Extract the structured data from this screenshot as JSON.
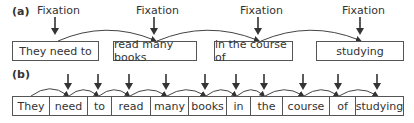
{
  "panel_a": {
    "label": "(a)",
    "fixation_label": "Fixation",
    "chunks": [
      {
        "text": "They need to",
        "x": 12,
        "w": 87
      },
      {
        "text": "read many books",
        "x": 113,
        "w": 84
      },
      {
        "text": "in the course of",
        "x": 214,
        "w": 79
      },
      {
        "text": "studying",
        "x": 316,
        "w": 88
      }
    ],
    "fixation_x": [
      55,
      153,
      253,
      360
    ]
  },
  "panel_b": {
    "label": "(b)",
    "words": [
      {
        "text": "They",
        "x": 12,
        "w": 38
      },
      {
        "text": "need",
        "x": 49,
        "w": 39
      },
      {
        "text": "to",
        "x": 87,
        "w": 25
      },
      {
        "text": "read",
        "x": 111,
        "w": 40
      },
      {
        "text": "many",
        "x": 150,
        "w": 39
      },
      {
        "text": "books",
        "x": 188,
        "w": 39
      },
      {
        "text": "in",
        "x": 226,
        "w": 25
      },
      {
        "text": "the",
        "x": 250,
        "w": 33
      },
      {
        "text": "course",
        "x": 282,
        "w": 48
      },
      {
        "text": "of",
        "x": 329,
        "w": 27
      },
      {
        "text": "studying",
        "x": 355,
        "w": 49
      }
    ],
    "fixation_x": [
      68,
      98,
      129,
      166,
      205,
      236,
      264,
      303,
      338,
      377
    ]
  }
}
